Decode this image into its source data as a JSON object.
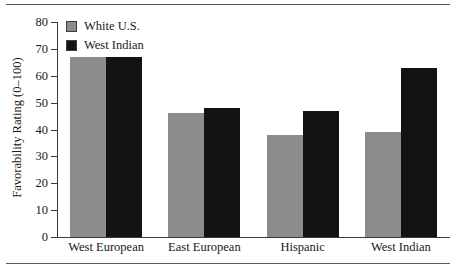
{
  "figure": {
    "top_rule": true,
    "bottom_rule": true
  },
  "chart_data": {
    "type": "bar",
    "title": "",
    "subtitle": "",
    "xlabel": "",
    "ylabel": "Favorability Rating (0–100)",
    "categories": [
      "West European",
      "East European",
      "Hispanic",
      "West Indian"
    ],
    "series": [
      {
        "name": "White U.S.",
        "color": "#8c8c8c",
        "values": [
          67,
          46,
          38,
          39
        ]
      },
      {
        "name": "West Indian",
        "color": "#131313",
        "values": [
          67,
          48,
          47,
          63
        ]
      }
    ],
    "ylim": [
      0,
      80
    ],
    "yticks": [
      0,
      10,
      20,
      30,
      40,
      50,
      60,
      70,
      80
    ],
    "ytick_labels": [
      "0",
      "10",
      "20",
      "30",
      "40",
      "50",
      "60",
      "70",
      "80"
    ],
    "grid": false,
    "legend_position": "top-left"
  }
}
